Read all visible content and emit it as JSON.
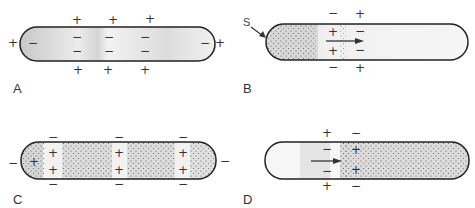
{
  "panels": [
    {
      "label": "A",
      "description": "Resting fiber, polarized: inside negative, outside positive"
    },
    {
      "label": "B",
      "description": "Stimulus at S depolarizes membrane; impulse travels right"
    },
    {
      "label": "C",
      "description": "Multiple depolarized regions; signs reversed"
    },
    {
      "label": "D",
      "description": "Impulse propagating; repolarization behind the wave front"
    }
  ],
  "stimulus_label": "S",
  "signs": {
    "plus": "+",
    "minus": "−"
  },
  "colors": {
    "outline": "#222222",
    "shade": "#d0d0d0",
    "text": "#333333",
    "dots": "#555555"
  }
}
